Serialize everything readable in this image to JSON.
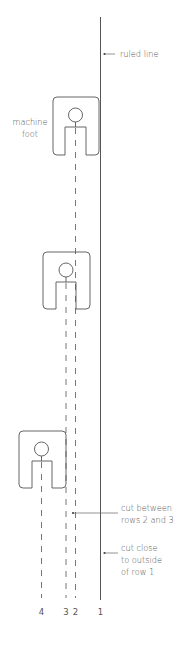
{
  "diagram": {
    "type": "sewing-machine-foot cutting guide",
    "colors": {
      "line": "#555555",
      "dash": "#666666",
      "text": "#555555",
      "background": "#ffffff"
    },
    "labels": {
      "ruled_line": "ruled line",
      "machine_foot_line1": "machine",
      "machine_foot_line2": "foot",
      "cut_between_line1": "cut between",
      "cut_between_line2": "rows 2 and 3",
      "cut_close_line1": "cut close",
      "cut_close_line2": "to outside",
      "cut_close_line3": "of row 1"
    },
    "row_numbers": {
      "row4": "4",
      "row3": "3",
      "row2": "2",
      "row1": "1"
    },
    "feet": [
      {
        "name": "foot-1",
        "x": 53,
        "y": 97
      },
      {
        "name": "foot-2",
        "x": 43,
        "y": 252
      },
      {
        "name": "foot-3",
        "x": 19,
        "y": 431
      }
    ]
  }
}
